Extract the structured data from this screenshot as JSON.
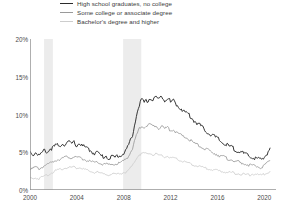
{
  "legend": {
    "position": "top-center",
    "items": [
      {
        "label": "High school graduates, no college",
        "color": "#2b2b2b",
        "swatch": "legend-swatch-hs"
      },
      {
        "label": "Some college or associate degree",
        "color": "#9a9a9a",
        "swatch": "legend-swatch-somecollege"
      },
      {
        "label": "Bachelor's degree and higher",
        "color": "#cdcdcd",
        "swatch": "legend-swatch-bachelors"
      }
    ]
  },
  "axes": {
    "y_ticks": [
      "0%",
      "5%",
      "10%",
      "15%",
      "20%"
    ],
    "x_ticks": [
      "2000",
      "2004",
      "2008",
      "2012",
      "2016",
      "2020"
    ]
  },
  "chart_data": {
    "type": "line",
    "title": "",
    "subtitle": "",
    "xlabel": "",
    "ylabel": "",
    "xlim": [
      2000,
      2021
    ],
    "ylim": [
      0,
      20
    ],
    "grid": false,
    "legend_position": "top-center",
    "x_tick_values": [
      2000,
      2004,
      2008,
      2012,
      2016,
      2020
    ],
    "y_tick_values": [
      0,
      5,
      10,
      15,
      20
    ],
    "y_unit": "percent",
    "annotations": [
      {
        "type": "shaded-band",
        "name": "recession-2001",
        "x_start": 2001.2,
        "x_end": 2001.95
      },
      {
        "type": "shaded-band",
        "name": "recession-2008",
        "x_start": 2007.95,
        "x_end": 2009.5
      }
    ],
    "x": [
      2000.0,
      2000.25,
      2000.5,
      2000.75,
      2001.0,
      2001.25,
      2001.5,
      2001.75,
      2002.0,
      2002.25,
      2002.5,
      2002.75,
      2003.0,
      2003.25,
      2003.5,
      2003.75,
      2004.0,
      2004.25,
      2004.5,
      2004.75,
      2005.0,
      2005.25,
      2005.5,
      2005.75,
      2006.0,
      2006.25,
      2006.5,
      2006.75,
      2007.0,
      2007.25,
      2007.5,
      2007.75,
      2008.0,
      2008.25,
      2008.5,
      2008.75,
      2009.0,
      2009.25,
      2009.5,
      2009.75,
      2010.0,
      2010.25,
      2010.5,
      2010.75,
      2011.0,
      2011.25,
      2011.5,
      2011.75,
      2012.0,
      2012.25,
      2012.5,
      2012.75,
      2013.0,
      2013.25,
      2013.5,
      2013.75,
      2014.0,
      2014.25,
      2014.5,
      2014.75,
      2015.0,
      2015.25,
      2015.5,
      2015.75,
      2016.0,
      2016.25,
      2016.5,
      2016.75,
      2017.0,
      2017.25,
      2017.5,
      2017.75,
      2018.0,
      2018.25,
      2018.5,
      2018.75,
      2019.0,
      2019.25,
      2019.5,
      2019.75,
      2020.0,
      2020.25,
      2020.5
    ],
    "series": [
      {
        "name": "High school graduates, no college",
        "color": "#2b2b2b",
        "values": [
          5.1,
          4.7,
          5.0,
          4.6,
          4.8,
          5.3,
          5.0,
          5.5,
          5.6,
          6.0,
          5.7,
          6.2,
          6.0,
          6.4,
          6.1,
          6.3,
          5.9,
          6.2,
          5.8,
          5.6,
          5.4,
          5.1,
          4.9,
          5.0,
          4.6,
          4.4,
          4.5,
          4.2,
          4.4,
          4.3,
          4.6,
          4.5,
          4.9,
          5.4,
          6.3,
          7.1,
          9.3,
          10.9,
          11.9,
          11.6,
          11.8,
          12.1,
          11.9,
          12.4,
          11.9,
          12.6,
          11.8,
          12.3,
          11.6,
          11.9,
          11.3,
          11.0,
          10.6,
          10.3,
          10.1,
          9.6,
          9.2,
          8.9,
          8.6,
          8.2,
          7.9,
          7.5,
          7.3,
          7.1,
          6.8,
          6.5,
          6.2,
          6.0,
          5.8,
          5.6,
          5.4,
          5.2,
          5.0,
          4.8,
          4.6,
          4.5,
          4.3,
          4.2,
          4.1,
          4.0,
          4.3,
          4.9,
          5.6
        ]
      },
      {
        "name": "Some college or associate degree",
        "color": "#9a9a9a",
        "values": [
          3.0,
          2.8,
          3.0,
          2.8,
          3.0,
          3.3,
          3.3,
          3.6,
          3.8,
          4.0,
          4.1,
          4.2,
          4.3,
          4.4,
          4.3,
          4.4,
          4.2,
          4.3,
          4.1,
          4.0,
          3.8,
          3.7,
          3.6,
          3.7,
          3.5,
          3.4,
          3.4,
          3.3,
          3.4,
          3.4,
          3.5,
          3.6,
          3.9,
          4.2,
          4.8,
          5.4,
          6.8,
          7.9,
          8.5,
          8.4,
          8.5,
          8.7,
          8.4,
          8.6,
          8.2,
          8.5,
          8.1,
          8.3,
          7.9,
          8.0,
          7.6,
          7.4,
          7.1,
          7.0,
          6.8,
          6.5,
          6.2,
          6.0,
          5.8,
          5.6,
          5.4,
          5.2,
          5.0,
          4.9,
          4.7,
          4.5,
          4.4,
          4.2,
          4.1,
          4.0,
          3.8,
          3.7,
          3.6,
          3.5,
          3.4,
          3.3,
          3.2,
          3.1,
          3.1,
          3.0,
          3.2,
          3.6,
          3.9
        ]
      },
      {
        "name": "Bachelor's degree and higher",
        "color": "#cdcdcd",
        "values": [
          1.6,
          1.5,
          1.6,
          1.5,
          1.7,
          1.9,
          2.0,
          2.2,
          2.4,
          2.6,
          2.7,
          2.8,
          2.9,
          3.0,
          3.0,
          3.1,
          2.9,
          3.0,
          2.8,
          2.7,
          2.5,
          2.4,
          2.3,
          2.4,
          2.2,
          2.1,
          2.1,
          2.0,
          2.1,
          2.1,
          2.1,
          2.2,
          2.3,
          2.4,
          2.8,
          3.2,
          4.0,
          4.6,
          4.8,
          4.9,
          4.8,
          4.9,
          4.6,
          4.8,
          4.5,
          4.6,
          4.3,
          4.5,
          4.2,
          4.2,
          4.1,
          4.0,
          3.8,
          3.7,
          3.6,
          3.4,
          3.3,
          3.2,
          3.1,
          3.0,
          2.9,
          2.8,
          2.7,
          2.6,
          2.6,
          2.5,
          2.4,
          2.4,
          2.3,
          2.3,
          2.2,
          2.2,
          2.1,
          2.1,
          2.0,
          2.0,
          2.1,
          2.1,
          2.0,
          2.0,
          2.1,
          2.3,
          2.5
        ]
      }
    ]
  }
}
